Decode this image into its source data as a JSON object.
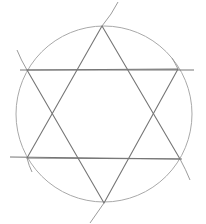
{
  "drawing": {
    "title": "Hexagram inscribed in a circle",
    "style": "pencil sketch",
    "colors": {
      "background": "#ffffff",
      "circle": "#a9a9a9",
      "lines": "#767676",
      "arcs": "#9c9c9c"
    },
    "circle": {
      "cx": 104,
      "cy": 114,
      "r": 88
    },
    "vertices": {
      "top": [
        102,
        26
      ],
      "upper_right": [
        178,
        69
      ],
      "lower_right": [
        180,
        159
      ],
      "bottom": [
        104,
        203
      ],
      "lower_left": [
        27,
        158
      ],
      "upper_left": [
        27,
        70
      ]
    },
    "triangles": [
      {
        "name": "upward",
        "points": "102,26 180,159 27,158"
      },
      {
        "name": "downward",
        "points": "27,70 178,69 104,203"
      }
    ],
    "horizontal_extensions": [
      {
        "x1": 20,
        "y1": 70,
        "x2": 194,
        "y2": 70
      },
      {
        "x1": 10,
        "y1": 157,
        "x2": 182,
        "y2": 159
      }
    ],
    "construction_arcs": [
      {
        "d": "M 118 2 Q 112 14 102 26"
      },
      {
        "d": "M 17 50 Q 21 60 27 70"
      },
      {
        "d": "M 180 159 Q 186 170 190 180"
      },
      {
        "d": "M 104 203 Q 97 213 90 223"
      },
      {
        "d": "M 172 58 Q 175 63 178 69"
      },
      {
        "d": "M 27 158 Q 29 166 32 172"
      }
    ]
  }
}
